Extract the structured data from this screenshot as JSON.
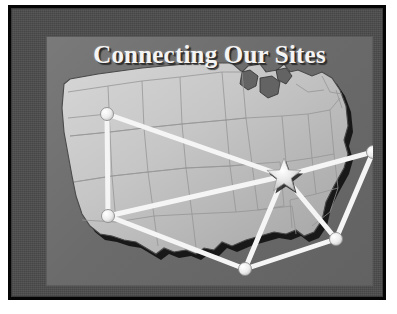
{
  "slide": {
    "title": "Connecting Our Sites",
    "background_color": "#4b4b4b",
    "panel_color": "#6d6d6d",
    "frame_color": "#050505",
    "title_color": "#f4f4f4"
  },
  "map": {
    "region": "Continental United States",
    "fill_color": "#c9c9c9",
    "outline_color": "#3a3a3a",
    "shadow_color": "#151515",
    "state_border_color": "#8f8f8f"
  },
  "network": {
    "hub_marker": "star-icon",
    "hub_color": "#f0f0f0",
    "node_color": "#f2f2f2",
    "link_color": "#f5f5f5",
    "nodes": [
      {
        "id": "nw",
        "label": "Northwest Site",
        "x": 61,
        "y": 78,
        "r": 6.5
      },
      {
        "id": "sw",
        "label": "Southwest Site",
        "x": 62,
        "y": 180,
        "r": 6.5
      },
      {
        "id": "s",
        "label": "South Site",
        "x": 199,
        "y": 233,
        "r": 6.5
      },
      {
        "id": "se",
        "label": "Southeast Site",
        "x": 290,
        "y": 203,
        "r": 6.5
      },
      {
        "id": "ne",
        "label": "Northeast Site",
        "x": 327,
        "y": 116,
        "r": 6.5
      },
      {
        "id": "hub",
        "label": "Headquarters Hub",
        "x": 238,
        "y": 140,
        "r": 18
      }
    ],
    "links": [
      {
        "from": "nw",
        "to": "sw"
      },
      {
        "from": "nw",
        "to": "hub"
      },
      {
        "from": "sw",
        "to": "hub"
      },
      {
        "from": "sw",
        "to": "s"
      },
      {
        "from": "s",
        "to": "hub"
      },
      {
        "from": "s",
        "to": "se"
      },
      {
        "from": "se",
        "to": "hub"
      },
      {
        "from": "se",
        "to": "ne"
      },
      {
        "from": "ne",
        "to": "hub"
      }
    ]
  }
}
